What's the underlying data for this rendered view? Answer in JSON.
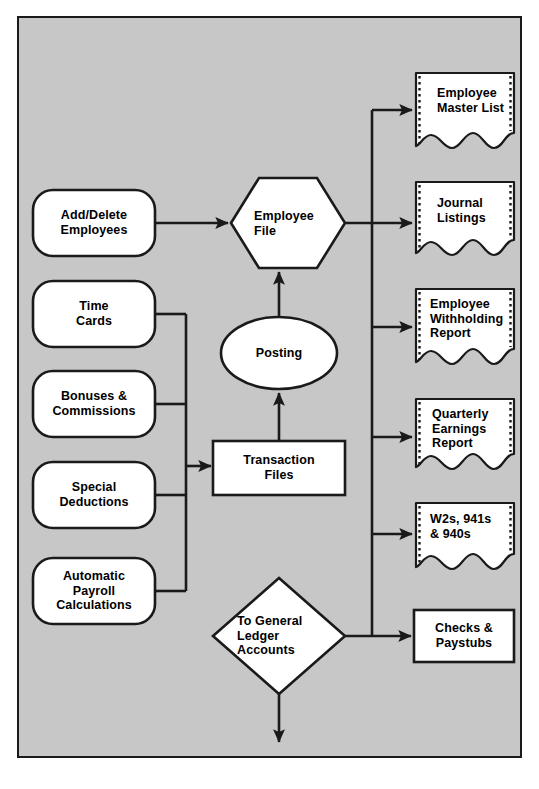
{
  "diagram": {
    "type": "flowchart",
    "background_color": "#c7c7c7",
    "page_color": "#ffffff",
    "line_color": "#1a1a1a",
    "shape_fill": "#ffffff",
    "inputs": [
      {
        "id": "add-delete-employees",
        "label": "Add/Delete\nEmployees",
        "shape": "rounded-rectangle"
      },
      {
        "id": "time-cards",
        "label": "Time\nCards",
        "shape": "rounded-rectangle"
      },
      {
        "id": "bonuses-commissions",
        "label": "Bonuses &\nCommissions",
        "shape": "rounded-rectangle"
      },
      {
        "id": "special-deductions",
        "label": "Special\nDeductions",
        "shape": "rounded-rectangle"
      },
      {
        "id": "automatic-payroll-calculations",
        "label": "Automatic\nPayroll\nCalculations",
        "shape": "rounded-rectangle"
      }
    ],
    "processes": [
      {
        "id": "employee-file",
        "label": "Employee\nFile",
        "shape": "hexagon"
      },
      {
        "id": "posting",
        "label": "Posting",
        "shape": "ellipse"
      },
      {
        "id": "transaction-files",
        "label": "Transaction\nFiles",
        "shape": "rectangle"
      },
      {
        "id": "to-general-ledger-accounts",
        "label": "To General\nLedger\nAccounts",
        "shape": "diamond"
      }
    ],
    "outputs": [
      {
        "id": "employee-master-list",
        "label": "Employee\nMaster List",
        "shape": "document"
      },
      {
        "id": "journal-listings",
        "label": "Journal\nListings",
        "shape": "document"
      },
      {
        "id": "employee-withholding-report",
        "label": "Employee\nWithholding\nReport",
        "shape": "document"
      },
      {
        "id": "quarterly-earnings-report",
        "label": "Quarterly\nEarnings\nReport",
        "shape": "document"
      },
      {
        "id": "w2s-941s-940s",
        "label": "W2s, 941s\n& 940s",
        "shape": "document"
      },
      {
        "id": "checks-paystubs",
        "label": "Checks &\nPaystubs",
        "shape": "rectangle"
      }
    ],
    "connections": [
      {
        "from": "add-delete-employees",
        "to": "employee-file"
      },
      {
        "from": "time-cards",
        "to": "transaction-files"
      },
      {
        "from": "bonuses-commissions",
        "to": "transaction-files"
      },
      {
        "from": "special-deductions",
        "to": "transaction-files"
      },
      {
        "from": "automatic-payroll-calculations",
        "to": "transaction-files"
      },
      {
        "from": "transaction-files",
        "to": "posting"
      },
      {
        "from": "posting",
        "to": "employee-file"
      },
      {
        "from": "employee-file",
        "to": "employee-master-list"
      },
      {
        "from": "employee-file",
        "to": "journal-listings"
      },
      {
        "from": "employee-file",
        "to": "employee-withholding-report"
      },
      {
        "from": "employee-file",
        "to": "quarterly-earnings-report"
      },
      {
        "from": "employee-file",
        "to": "w2s-941s-940s"
      },
      {
        "from": "to-general-ledger-accounts",
        "to": "checks-paystubs"
      },
      {
        "from": "to-general-ledger-accounts",
        "to": "exit-arrow"
      }
    ]
  }
}
